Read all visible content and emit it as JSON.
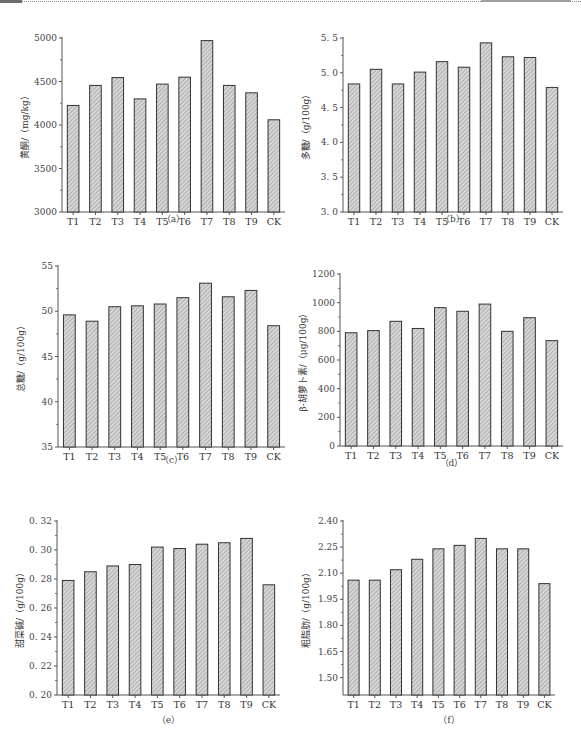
{
  "page": {
    "header_rule": "dotted",
    "hatch_color": "#9a9a9a",
    "bar_stroke": "#333333",
    "axis_color": "#555555"
  },
  "chart_data": [
    {
      "id": "a",
      "type": "bar",
      "caption": "（a）",
      "title": "",
      "xlabel": "",
      "ylabel": "黄酮/（mg/kg）",
      "categories": [
        "T1",
        "T2",
        "T3",
        "T4",
        "T5",
        "T6",
        "T7",
        "T8",
        "T9",
        "CK"
      ],
      "values": [
        4225,
        4455,
        4545,
        4300,
        4470,
        4550,
        4970,
        4455,
        4370,
        4060
      ],
      "ylim": [
        3000,
        5000
      ],
      "yticks": [
        3000,
        3500,
        4000,
        4500,
        5000
      ],
      "ytick_labels": [
        "3000",
        "3500",
        "4000",
        "4500",
        "5000"
      ],
      "grid": false,
      "legend": null,
      "fill": "diagonal hatch"
    },
    {
      "id": "b",
      "type": "bar",
      "caption": "（b）",
      "title": "",
      "xlabel": "",
      "ylabel": "多糖/（g/100g）",
      "categories": [
        "T1",
        "T2",
        "T3",
        "T4",
        "T5",
        "T6",
        "T7",
        "T8",
        "T9",
        "CK"
      ],
      "values": [
        4.84,
        5.05,
        4.84,
        5.01,
        5.16,
        5.08,
        5.43,
        5.23,
        5.22,
        4.79
      ],
      "ylim": [
        3.0,
        5.5
      ],
      "yticks": [
        3.0,
        3.5,
        4.0,
        4.5,
        5.0,
        5.5
      ],
      "ytick_labels": [
        "3. 0",
        "3. 5",
        "4. 0",
        "4. 5",
        "5. 0",
        "5. 5"
      ],
      "grid": false,
      "legend": null,
      "fill": "diagonal hatch"
    },
    {
      "id": "c",
      "type": "bar",
      "caption": "（c）",
      "title": "",
      "xlabel": "",
      "ylabel": "总糖/（g/100g）",
      "categories": [
        "T1",
        "T2",
        "T3",
        "T4",
        "T5",
        "T6",
        "T7",
        "T8",
        "T9",
        "CK"
      ],
      "values": [
        49.6,
        48.9,
        50.5,
        50.6,
        50.8,
        51.5,
        53.1,
        51.6,
        52.3,
        48.4
      ],
      "ylim": [
        35,
        55
      ],
      "yticks": [
        35,
        40,
        45,
        50,
        55
      ],
      "ytick_labels": [
        "35",
        "40",
        "45",
        "50",
        "55"
      ],
      "grid": false,
      "legend": null,
      "fill": "diagonal hatch"
    },
    {
      "id": "d",
      "type": "bar",
      "caption": "（d）",
      "title": "",
      "xlabel": "",
      "ylabel": "β-胡萝卜素/（μg/100g）",
      "categories": [
        "T1",
        "T2",
        "T3",
        "T4",
        "T5",
        "T6",
        "T7",
        "T8",
        "T9",
        "CK"
      ],
      "values": [
        790,
        805,
        870,
        820,
        965,
        940,
        990,
        800,
        895,
        735
      ],
      "ylim": [
        0,
        1200
      ],
      "yticks": [
        0,
        200,
        400,
        600,
        800,
        1000,
        1200
      ],
      "ytick_labels": [
        "0",
        "200",
        "400",
        "600",
        "800",
        "1000",
        "1200"
      ],
      "grid": false,
      "legend": null,
      "fill": "diagonal hatch"
    },
    {
      "id": "e",
      "type": "bar",
      "caption": "（e）",
      "title": "",
      "xlabel": "",
      "ylabel": "甜菜碱/（g/100g）",
      "categories": [
        "T1",
        "T2",
        "T3",
        "T4",
        "T5",
        "T6",
        "T7",
        "T8",
        "T9",
        "CK"
      ],
      "values": [
        0.279,
        0.285,
        0.289,
        0.29,
        0.302,
        0.301,
        0.304,
        0.305,
        0.308,
        0.276
      ],
      "ylim": [
        0.2,
        0.32
      ],
      "yticks": [
        0.2,
        0.22,
        0.24,
        0.26,
        0.28,
        0.3,
        0.32
      ],
      "ytick_labels": [
        "0. 20",
        "0. 22",
        "0. 24",
        "0. 26",
        "0. 28",
        "0. 30",
        "0. 32"
      ],
      "grid": false,
      "legend": null,
      "fill": "diagonal hatch"
    },
    {
      "id": "f",
      "type": "bar",
      "caption": "（f）",
      "title": "",
      "xlabel": "",
      "ylabel": "粗脂肪/（g/100g）",
      "categories": [
        "T1",
        "T2",
        "T3",
        "T4",
        "T5",
        "T6",
        "T7",
        "T8",
        "T9",
        "CK"
      ],
      "values": [
        2.06,
        2.06,
        2.12,
        2.18,
        2.24,
        2.26,
        2.3,
        2.24,
        2.24,
        2.04
      ],
      "ylim": [
        1.4,
        2.4
      ],
      "yticks": [
        1.5,
        1.65,
        1.8,
        1.95,
        2.1,
        2.25,
        2.4
      ],
      "ytick_labels": [
        "1.50",
        "1.65",
        "1.80",
        "1.95",
        "2.10",
        "2.25",
        "2.40"
      ],
      "grid": false,
      "legend": null,
      "fill": "diagonal hatch"
    }
  ]
}
